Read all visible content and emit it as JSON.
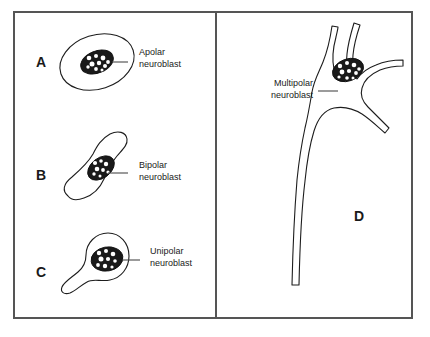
{
  "figure": {
    "background_color": "#ffffff",
    "frame_color": "#555555",
    "ink_color": "#1d1d1d",
    "nucleus_color": "#1a1a1a",
    "leader_color": "#4a4a4a",
    "panels": [
      {
        "letter": "A",
        "letter_x": 36,
        "letter_y": 67,
        "label_line1": "Apolar",
        "label_line2": "neuroblast",
        "label_x": 139,
        "label_y": 55,
        "leader_x1": 128,
        "leader_y1": 62,
        "leader_x2": 112,
        "leader_y2": 62,
        "cell_type": "apolar",
        "description": "round-oval neuroblast with no processes"
      },
      {
        "letter": "B",
        "letter_x": 36,
        "letter_y": 180,
        "label_line1": "Bipolar",
        "label_line2": "neuroblast",
        "label_x": 139,
        "label_y": 168,
        "leader_x1": 128,
        "leader_y1": 173,
        "leader_x2": 108,
        "leader_y2": 173,
        "cell_type": "bipolar",
        "description": "spindle-shaped neuroblast with two opposite processes"
      },
      {
        "letter": "C",
        "letter_x": 36,
        "letter_y": 277,
        "label_line1": "Unipolar",
        "label_line2": "neuroblast",
        "label_x": 150,
        "label_y": 254,
        "leader_x1": 140,
        "leader_y1": 260,
        "leader_x2": 122,
        "leader_y2": 260,
        "cell_type": "unipolar",
        "description": "pear-shaped neuroblast with a single process"
      },
      {
        "letter": "D",
        "letter_x": 354,
        "letter_y": 221,
        "label_line1": "Multipolar",
        "label_line2": "neuroblast",
        "label_x": 313,
        "label_y": 86,
        "leader_x1": 318,
        "leader_y1": 91,
        "leader_x2": 338,
        "leader_y2": 91,
        "cell_type": "multipolar",
        "description": "multipolar neuroblast with several dendrites and a long axon"
      }
    ]
  }
}
